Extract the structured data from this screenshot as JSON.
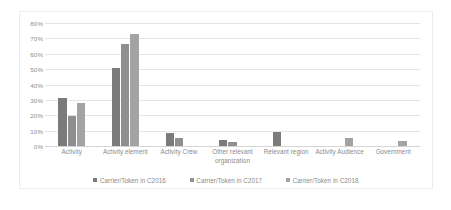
{
  "chart_data": {
    "type": "bar",
    "title": "",
    "subtitle": "",
    "xlabel": "",
    "ylabel": "",
    "ylim": [
      0,
      80
    ],
    "grid": true,
    "legend_position": "bottom",
    "y_ticks": [
      "0%",
      "10%",
      "20%",
      "30%",
      "40%",
      "50%",
      "60%",
      "70%",
      "80%"
    ],
    "y_tick_values": [
      0,
      10,
      20,
      30,
      40,
      50,
      60,
      70,
      80
    ],
    "categories": [
      "Activity",
      "Activity element",
      "Activity Crew",
      "Other relevant organization",
      "Relevant region",
      "Activity Audience",
      "Government"
    ],
    "series": [
      {
        "name": "Carrier/Token in C2016",
        "color": "#7b7b7b",
        "values": [
          31,
          50.5,
          8.5,
          4.2,
          9.0,
          0,
          0
        ]
      },
      {
        "name": "Carrier/Token in C2017",
        "color": "#8f8f8f",
        "values": [
          19.5,
          66.5,
          5.0,
          2.5,
          0,
          0,
          0
        ]
      },
      {
        "name": "Carrier/Token in C2018",
        "color": "#a3a3a3",
        "values": [
          28,
          73,
          0,
          0,
          0,
          5.5,
          3.5
        ]
      }
    ]
  },
  "style": {
    "frame_border_color": "#ececed",
    "gridline_color": "#e4e4e4",
    "axis_color": "#d4d4d4",
    "tick_text_color": "#8c8c8c",
    "label_text_color": "#8a8a8a",
    "background": "#ffffff"
  }
}
